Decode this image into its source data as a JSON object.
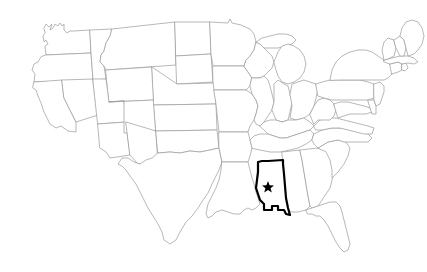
{
  "map": {
    "title": "United States outline map",
    "region": "Contiguous United States",
    "background_color": "#ffffff",
    "border_color": "#9a9a9a",
    "highlight_color": "#000000",
    "highlight_fill": "#ffffff",
    "star_color": "#000000",
    "border_width_px": 0.7,
    "highlight_width_px": 2.2,
    "highlighted_state": {
      "name": "Mississippi",
      "abbreviation": "MS",
      "capital": "Jackson",
      "capital_marker": "star",
      "capital_x": 268,
      "capital_y": 186
    },
    "width": 427,
    "height": 272,
    "labels_visible": false,
    "legend_visible": false
  },
  "states": [
    {
      "name": "Washington",
      "abbreviation": "WA",
      "highlighted": false
    },
    {
      "name": "Oregon",
      "abbreviation": "OR",
      "highlighted": false
    },
    {
      "name": "California",
      "abbreviation": "CA",
      "highlighted": false
    },
    {
      "name": "Nevada",
      "abbreviation": "NV",
      "highlighted": false
    },
    {
      "name": "Idaho",
      "abbreviation": "ID",
      "highlighted": false
    },
    {
      "name": "Montana",
      "abbreviation": "MT",
      "highlighted": false
    },
    {
      "name": "Wyoming",
      "abbreviation": "WY",
      "highlighted": false
    },
    {
      "name": "Utah",
      "abbreviation": "UT",
      "highlighted": false
    },
    {
      "name": "Arizona",
      "abbreviation": "AZ",
      "highlighted": false
    },
    {
      "name": "Colorado",
      "abbreviation": "CO",
      "highlighted": false
    },
    {
      "name": "New Mexico",
      "abbreviation": "NM",
      "highlighted": false
    },
    {
      "name": "North Dakota",
      "abbreviation": "ND",
      "highlighted": false
    },
    {
      "name": "South Dakota",
      "abbreviation": "SD",
      "highlighted": false
    },
    {
      "name": "Nebraska",
      "abbreviation": "NE",
      "highlighted": false
    },
    {
      "name": "Kansas",
      "abbreviation": "KS",
      "highlighted": false
    },
    {
      "name": "Oklahoma",
      "abbreviation": "OK",
      "highlighted": false
    },
    {
      "name": "Texas",
      "abbreviation": "TX",
      "highlighted": false
    },
    {
      "name": "Minnesota",
      "abbreviation": "MN",
      "highlighted": false
    },
    {
      "name": "Iowa",
      "abbreviation": "IA",
      "highlighted": false
    },
    {
      "name": "Missouri",
      "abbreviation": "MO",
      "highlighted": false
    },
    {
      "name": "Arkansas",
      "abbreviation": "AR",
      "highlighted": false
    },
    {
      "name": "Louisiana",
      "abbreviation": "LA",
      "highlighted": false
    },
    {
      "name": "Wisconsin",
      "abbreviation": "WI",
      "highlighted": false
    },
    {
      "name": "Illinois",
      "abbreviation": "IL",
      "highlighted": false
    },
    {
      "name": "Michigan",
      "abbreviation": "MI",
      "highlighted": false
    },
    {
      "name": "Indiana",
      "abbreviation": "IN",
      "highlighted": false
    },
    {
      "name": "Ohio",
      "abbreviation": "OH",
      "highlighted": false
    },
    {
      "name": "Kentucky",
      "abbreviation": "KY",
      "highlighted": false
    },
    {
      "name": "Tennessee",
      "abbreviation": "TN",
      "highlighted": false
    },
    {
      "name": "Mississippi",
      "abbreviation": "MS",
      "highlighted": true
    },
    {
      "name": "Alabama",
      "abbreviation": "AL",
      "highlighted": false
    },
    {
      "name": "Georgia",
      "abbreviation": "GA",
      "highlighted": false
    },
    {
      "name": "Florida",
      "abbreviation": "FL",
      "highlighted": false
    },
    {
      "name": "South Carolina",
      "abbreviation": "SC",
      "highlighted": false
    },
    {
      "name": "North Carolina",
      "abbreviation": "NC",
      "highlighted": false
    },
    {
      "name": "Virginia",
      "abbreviation": "VA",
      "highlighted": false
    },
    {
      "name": "West Virginia",
      "abbreviation": "WV",
      "highlighted": false
    },
    {
      "name": "Maryland",
      "abbreviation": "MD",
      "highlighted": false
    },
    {
      "name": "Delaware",
      "abbreviation": "DE",
      "highlighted": false
    },
    {
      "name": "Pennsylvania",
      "abbreviation": "PA",
      "highlighted": false
    },
    {
      "name": "New Jersey",
      "abbreviation": "NJ",
      "highlighted": false
    },
    {
      "name": "New York",
      "abbreviation": "NY",
      "highlighted": false
    },
    {
      "name": "Connecticut",
      "abbreviation": "CT",
      "highlighted": false
    },
    {
      "name": "Rhode Island",
      "abbreviation": "RI",
      "highlighted": false
    },
    {
      "name": "Massachusetts",
      "abbreviation": "MA",
      "highlighted": false
    },
    {
      "name": "Vermont",
      "abbreviation": "VT",
      "highlighted": false
    },
    {
      "name": "New Hampshire",
      "abbreviation": "NH",
      "highlighted": false
    },
    {
      "name": "Maine",
      "abbreviation": "ME",
      "highlighted": false
    }
  ]
}
